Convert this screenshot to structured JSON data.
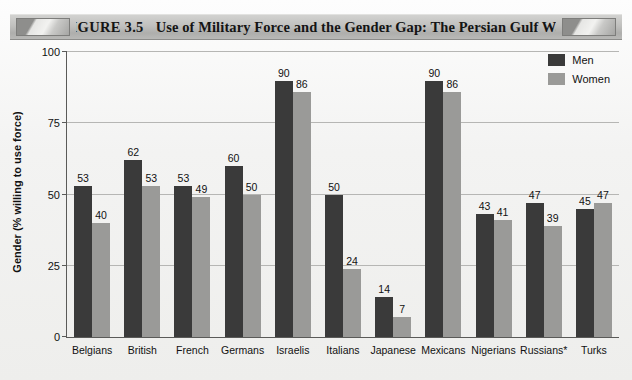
{
  "banner": {
    "figure_number": "FIGURE 3.5",
    "title": "Use of Military Force and the Gender Gap: The Persian Gulf War",
    "left_cap_icon": "decorative-bar-icon",
    "right_cap_icon": "decorative-bar-icon"
  },
  "chart_data": {
    "type": "bar",
    "title": "Use of Military Force and the Gender Gap: The Persian Gulf War",
    "xlabel": "",
    "ylabel": "Gender (% willing to use force)",
    "ylim": [
      0,
      100
    ],
    "yticks": [
      0,
      25,
      50,
      75,
      100
    ],
    "ytick_labels": [
      "0",
      "25",
      "50",
      "75",
      "100"
    ],
    "grid": true,
    "legend_position": "top-right",
    "categories": [
      "Belgians",
      "British",
      "French",
      "Germans",
      "Israelis",
      "Italians",
      "Japanese",
      "Mexicans",
      "Nigerians",
      "Russians*",
      "Turks"
    ],
    "series": [
      {
        "name": "Men",
        "color": "#3a3a3a",
        "values": [
          53,
          62,
          53,
          60,
          90,
          50,
          14,
          90,
          43,
          47,
          45
        ]
      },
      {
        "name": "Women",
        "color": "#9a9a98",
        "values": [
          40,
          53,
          49,
          50,
          86,
          24,
          7,
          86,
          41,
          39,
          47
        ]
      }
    ]
  },
  "legend": {
    "items": [
      {
        "label": "Men",
        "color": "#3a3a3a"
      },
      {
        "label": "Women",
        "color": "#9a9a98"
      }
    ]
  }
}
